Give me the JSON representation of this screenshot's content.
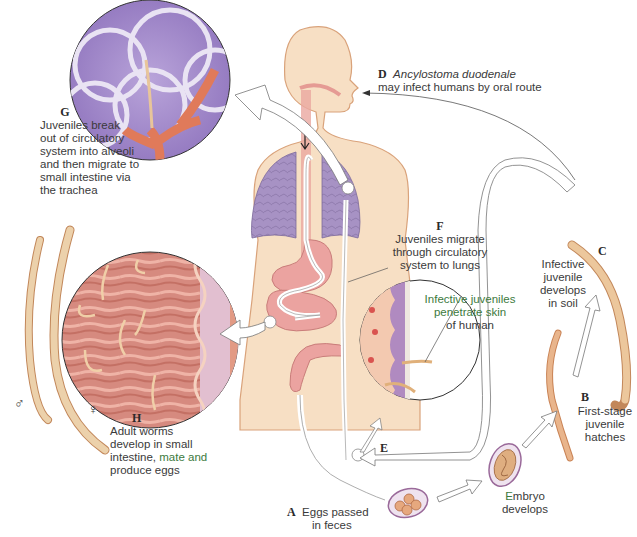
{
  "stages": {
    "A": {
      "letter": "A",
      "text_line1": "Eggs passed",
      "text_line2": "in feces"
    },
    "B": {
      "letter": "B",
      "text_line1": "First-stage",
      "text_line2": "juvenile",
      "text_line3": "hatches"
    },
    "C": {
      "letter": "C",
      "text_line1": "Infective",
      "text_line2": "juvenile",
      "text_line3": "develops",
      "text_line4": "in soil"
    },
    "D": {
      "letter": "D",
      "species": "Ancylostoma duodenale",
      "text": "may infect humans by oral route"
    },
    "E": {
      "letter": "E",
      "text_line1": "Infective juveniles",
      "text_line2": "penetrate skin",
      "text_line3": "of human"
    },
    "F": {
      "letter": "F",
      "text_line1": "Juveniles migrate",
      "text_line2": "through circulatory",
      "text_line3": "system to lungs"
    },
    "G": {
      "letter": "G",
      "text_line1": "Juveniles break",
      "text_line2": "out of circulatory",
      "text_line3": "system into alveoli",
      "text_line4": "and then migrate to",
      "text_line5": "small intestine via",
      "text_line6": "the trachea"
    },
    "H": {
      "letter": "H",
      "text_line1": "Adult worms",
      "text_line2": "develop in small",
      "text_line3_a": "intestine,",
      "text_line3_b": "mate and",
      "text_line4": "produce eggs"
    }
  },
  "embryo": {
    "text_line1": "Embryo",
    "text_line2": "develops"
  },
  "sex_symbols": {
    "male": "♂",
    "female": "♀"
  },
  "colors": {
    "skin": "#f7dfc4",
    "skin_outline": "#d9a27a",
    "lung": "#9b86b8",
    "alveoli": "#9a82c4",
    "intestine_tissue": "#d98a80",
    "gut": "#e9a0a0",
    "worm": "#e8c59a",
    "worm_outline": "#c2875a",
    "arrow_outline": "#7a7a7a",
    "text": "#3a3a3a",
    "green_text": "#3d7a3d"
  }
}
